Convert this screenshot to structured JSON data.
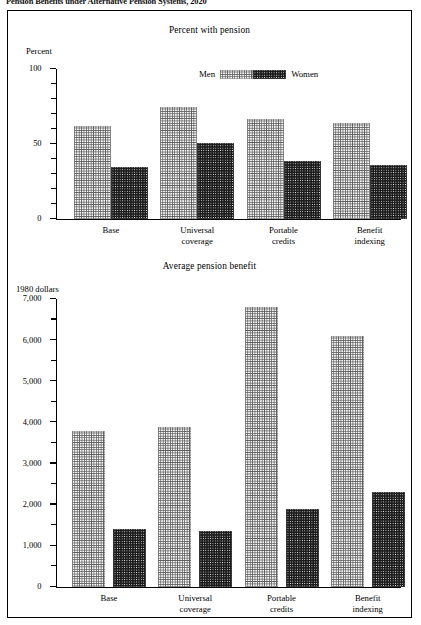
{
  "page": {
    "title": "Pension Benefits under Alternative Pension Systems, 2020"
  },
  "legend": {
    "men_label": "Men",
    "women_label": "Women",
    "men_swatch_name": "men-pattern-swatch",
    "women_swatch_name": "women-pattern-swatch"
  },
  "colors": {
    "men_pattern": "#5d5d5d",
    "women_pattern": "#1c1c1c",
    "axis": "#000000",
    "background": "#ffffff"
  },
  "chart_data": [
    {
      "type": "bar",
      "title": "Percent with pension",
      "xlabel": "",
      "ylabel": "Percent",
      "ylim": [
        0,
        100
      ],
      "yticks": [
        0,
        50,
        100
      ],
      "ytick_labels": [
        "0",
        "50",
        "100"
      ],
      "minor_tick_step": 10,
      "grid": false,
      "legend_position": "top-center",
      "categories": [
        "Base",
        "Universal coverage",
        "Portable credits",
        "Benefit indexing"
      ],
      "category_lines": [
        [
          "Base"
        ],
        [
          "Universal",
          "coverage"
        ],
        [
          "Portable",
          "credits"
        ],
        [
          "Benefit",
          "indexing"
        ]
      ],
      "series": [
        {
          "name": "Men",
          "values": [
            62,
            75,
            67,
            64
          ]
        },
        {
          "name": "Women",
          "values": [
            35,
            51,
            39,
            36
          ]
        }
      ]
    },
    {
      "type": "bar",
      "title": "Average pension benefit",
      "xlabel": "",
      "ylabel": "1980 dollars",
      "ylim": [
        0,
        7000
      ],
      "yticks": [
        0,
        1000,
        2000,
        3000,
        4000,
        5000,
        6000,
        7000
      ],
      "ytick_labels": [
        "0",
        "1,000",
        "2,000",
        "3,000",
        "4,000",
        "5,000",
        "6,000",
        "7,000"
      ],
      "minor_tick_step": 500,
      "grid": false,
      "legend_position": "none",
      "categories": [
        "Base",
        "Universal coverage",
        "Portable credits",
        "Benefit indexing"
      ],
      "category_lines": [
        [
          "Base"
        ],
        [
          "Universal",
          "coverage"
        ],
        [
          "Portable",
          "credits"
        ],
        [
          "Benefit",
          "indexing"
        ]
      ],
      "series": [
        {
          "name": "Men",
          "values": [
            3800,
            3900,
            6800,
            6100
          ]
        },
        {
          "name": "Women",
          "values": [
            1400,
            1350,
            1900,
            2300
          ]
        }
      ]
    }
  ]
}
